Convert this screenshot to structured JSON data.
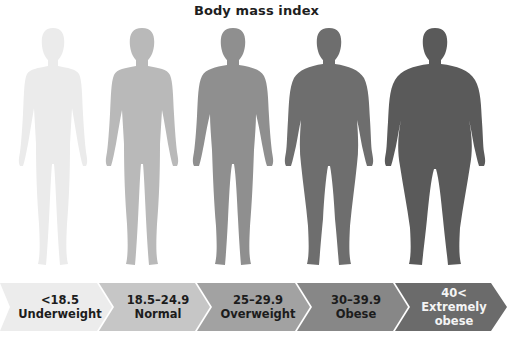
{
  "title": "Body mass index",
  "categories": [
    {
      "range": "<18.5",
      "label": "Underweight",
      "figure_color": "#ebebeb",
      "band_color": "#ececec",
      "text_color": "dark"
    },
    {
      "range": "18.5–24.9",
      "label": "Normal",
      "figure_color": "#b9b9b9",
      "band_color": "#c6c6c6",
      "text_color": "dark"
    },
    {
      "range": "25–29.9",
      "label": "Overweight",
      "figure_color": "#8f8f8f",
      "band_color": "#a2a2a2",
      "text_color": "dark"
    },
    {
      "range": "30–39.9",
      "label": "Obese",
      "figure_color": "#6e6e6e",
      "band_color": "#878787",
      "text_color": "dark"
    },
    {
      "range": "40<",
      "label": "Extremely",
      "label2": "obese",
      "figure_color": "#5a5a5a",
      "band_color": "#6b6b6b",
      "text_color": "light"
    }
  ]
}
